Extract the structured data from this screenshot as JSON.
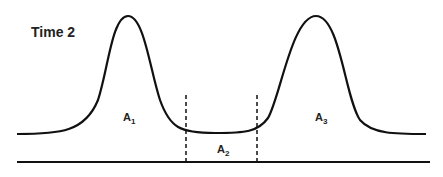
{
  "title": "Time 2",
  "labels": {
    "a1": {
      "base": "A",
      "sub": "1"
    },
    "a2": {
      "base": "A",
      "sub": "2"
    },
    "a3": {
      "base": "A",
      "sub": "3"
    }
  },
  "colors": {
    "line": "#111111",
    "background": "#ffffff"
  }
}
